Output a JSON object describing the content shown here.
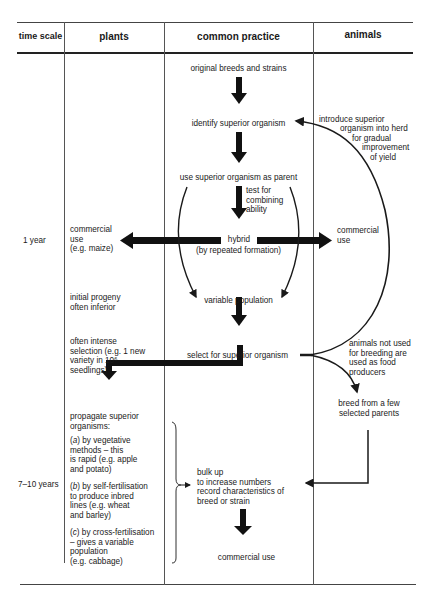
{
  "table": {
    "headers": {
      "time_scale": "time scale",
      "plants": "plants",
      "common_practice": "common practice",
      "animals": "animals"
    },
    "time_labels": {
      "row1": "1 year",
      "row2": "7–10 years"
    }
  },
  "common_practice": {
    "step1": "original breeds and strains",
    "step2": "identify superior organism",
    "step3": "use superior organism as parent",
    "test_note_1": "test for",
    "test_note_2": "combining",
    "test_note_3": "ability",
    "hybrid": "hybrid",
    "hybrid_note": "(by repeated formation)",
    "variable_population": "variable population",
    "select": "select for superior organism",
    "bulk_1": "bulk up",
    "bulk_2": "to increase numbers",
    "bulk_3": "record characteristics of",
    "bulk_4": "breed or strain",
    "commercial_use": "commercial use"
  },
  "plants": {
    "commercial_1": "commercial",
    "commercial_2": "use",
    "commercial_3": "(e.g. maize)",
    "progeny_1": "initial progeny",
    "progeny_2": "often inferior",
    "selection_1": "often intense",
    "selection_2": "selection (e.g. 1 new",
    "selection_3": "variety in 10",
    "selection_3_sup": "6",
    "selection_4": "seedlings)",
    "propagate_1": "propagate superior",
    "propagate_2": "organisms:",
    "a_label": "a",
    "a_1": "by vegetative",
    "a_2": "methods – this",
    "a_3": "is rapid (e.g. apple",
    "a_4": "and potato)",
    "b_label": "b",
    "b_1": "by self-fertilisation",
    "b_2": "to produce inbred",
    "b_3": "lines (e.g. wheat",
    "b_4": "and barley)",
    "c_label": "c",
    "c_1": "by cross-fertilisation",
    "c_2": "– gives a variable",
    "c_3": "population",
    "c_4": "(e.g. cabbage)"
  },
  "animals": {
    "introduce_1": "introduce superior",
    "introduce_2": "organism into herd",
    "introduce_3": "for gradual",
    "introduce_4": "improvement",
    "introduce_5": "of yield",
    "commercial_1": "commercial",
    "commercial_2": "use",
    "food_1": "animals not used",
    "food_2": "for breeding are",
    "food_3": "used as food",
    "food_4": "producers",
    "breed_1": "breed from a few",
    "breed_2": "selected parents"
  },
  "colors": {
    "ink": "#1a1a1a",
    "rule": "#222222",
    "divider": "#555555",
    "background": "#ffffff"
  }
}
